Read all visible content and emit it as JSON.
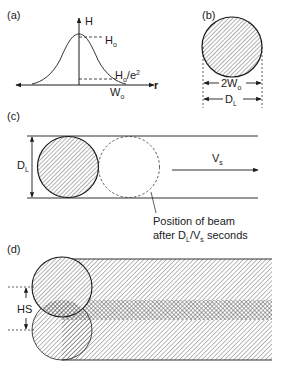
{
  "figure": {
    "panel_a": {
      "label": "(a)",
      "y_axis_label": "H",
      "x_axis_label": "r",
      "peak_label": "H",
      "peak_label_sub": "o",
      "level_label": "H",
      "level_label_sub": "o",
      "level_label_rest": "/e",
      "level_label_sup": "2",
      "width_label": "W",
      "width_label_sub": "o"
    },
    "panel_b": {
      "label": "(b)",
      "inner_dim_label": "2W",
      "inner_dim_sub": "o",
      "outer_dim_label": "D",
      "outer_dim_sub": "L"
    },
    "panel_c": {
      "label": "(c)",
      "height_label": "D",
      "height_label_sub": "L",
      "velocity_label": "V",
      "velocity_label_sub": "s",
      "caption_line1": "Position of beam",
      "caption_line2_a": "after D",
      "caption_line2_sub1": "L",
      "caption_line2_b": "/V",
      "caption_line2_sub2": "s",
      "caption_line2_c": " seconds"
    },
    "panel_d": {
      "label": "(d)",
      "spacing_label": "HS"
    },
    "colors": {
      "stroke": "#1a1a1a",
      "hatch": "#555555",
      "background": "#ffffff"
    }
  }
}
